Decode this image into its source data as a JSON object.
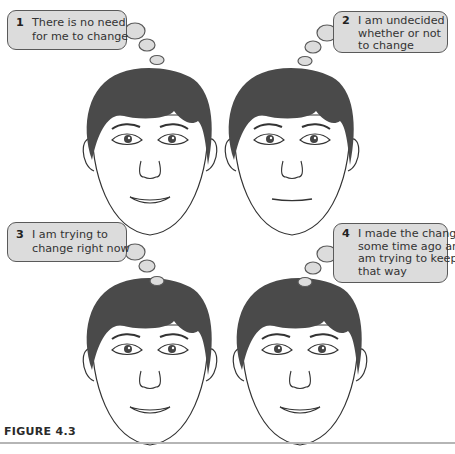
{
  "figure": {
    "caption": "FIGURE 4.3",
    "panels": [
      {
        "number": "1",
        "lines": [
          "There is no need",
          "for me to change"
        ],
        "expression": "smile"
      },
      {
        "number": "2",
        "lines": [
          "I am undecided",
          "whether or not",
          "to change"
        ],
        "expression": "neutral"
      },
      {
        "number": "3",
        "lines": [
          "I am trying  to",
          "change right now"
        ],
        "expression": "smile"
      },
      {
        "number": "4",
        "lines": [
          "I made the change",
          "some time ago and",
          "am trying to keep it",
          "that way"
        ],
        "expression": "smile"
      }
    ]
  },
  "colors": {
    "bubble_fill": "#dcdcdc",
    "bubble_stroke": "#5a5a5a",
    "hair": "#4a4a4a",
    "line": "#333333",
    "rule": "#b5b5b5"
  }
}
